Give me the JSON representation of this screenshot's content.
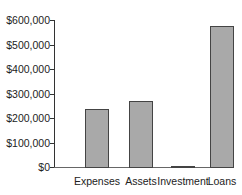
{
  "chart_data": {
    "type": "bar",
    "title": "",
    "xlabel": "",
    "ylabel": "",
    "categories": [
      "Expenses",
      "Assets",
      "Investment",
      "Loans"
    ],
    "values": [
      237000,
      270000,
      3000,
      575000
    ],
    "ylim": [
      0,
      600000
    ],
    "yticks": [
      0,
      100000,
      200000,
      300000,
      400000,
      500000,
      600000
    ],
    "ytick_labels": [
      "$0",
      "$100,000",
      "$200,000",
      "$300,000",
      "$400,000",
      "$500,000",
      "$600,000"
    ],
    "grid": false,
    "legend": null,
    "bar_color": "#a9a9a9",
    "bar_edge_color": "#444444"
  }
}
